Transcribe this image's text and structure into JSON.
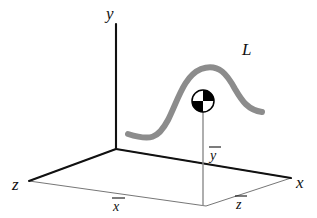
{
  "figure": {
    "type": "3d-coordinate-diagram",
    "title": "",
    "background_color": "#ffffff",
    "width": 317,
    "height": 218
  },
  "colors": {
    "axis": "#111111",
    "base_outline": "#555555",
    "curve": "#8c8c8c",
    "drop_line": "#8c8c8c",
    "marker_dark": "#000000",
    "marker_light": "#ffffff",
    "text": "#111111"
  },
  "axes": [
    {
      "id": "y-axis",
      "label": "y",
      "label_x": 108,
      "label_y": 18,
      "from": {
        "x": 116,
        "y": 149
      },
      "to": {
        "x": 116,
        "y": 24
      }
    },
    {
      "id": "x-axis",
      "label": "x",
      "label_x": 297,
      "label_y": 188,
      "from": {
        "x": 116,
        "y": 149
      },
      "to": {
        "x": 291,
        "y": 178
      }
    },
    {
      "id": "z-axis",
      "label": "z",
      "label_x": 12,
      "label_y": 190,
      "from": {
        "x": 116,
        "y": 149
      },
      "to": {
        "x": 29,
        "y": 181
      }
    }
  ],
  "base_plane": {
    "id": "reference-plane",
    "points": "116,149 291,178 206,206 29,181"
  },
  "curve": {
    "id": "curve-L",
    "label": "L",
    "label_x": 243,
    "label_y": 54,
    "path": "M 128,134 C 150,141 158,139 168,120 C 178,100 184,76 201,69 C 219,62 228,76 235,89 C 242,101 248,110 262,112",
    "stroke_width": 6
  },
  "marker": {
    "id": "point-marker",
    "center_x": 203,
    "center_y": 101,
    "radius": 11,
    "style": "quadrant-circle",
    "quadrants": {
      "top_left": "light",
      "top_right": "dark",
      "bottom_left": "dark",
      "bottom_right": "light"
    }
  },
  "drop_line": {
    "id": "ordinate-line",
    "from": {
      "x": 203,
      "y": 112
    },
    "to": {
      "x": 203,
      "y": 206
    }
  },
  "measurements": [
    {
      "id": "y-bar",
      "label": "y",
      "overbar": true,
      "x": 210,
      "y": 159,
      "bar_x1": 209,
      "bar_x2": 222,
      "bar_y": 145
    },
    {
      "id": "x-bar",
      "label": "x",
      "overbar": true,
      "x": 113,
      "y": 210,
      "bar_x1": 112,
      "bar_x2": 125,
      "bar_y": 197
    },
    {
      "id": "z-bar",
      "label": "z",
      "overbar": true,
      "x": 236,
      "y": 208,
      "bar_x1": 235,
      "bar_x2": 247,
      "bar_y": 195
    }
  ]
}
